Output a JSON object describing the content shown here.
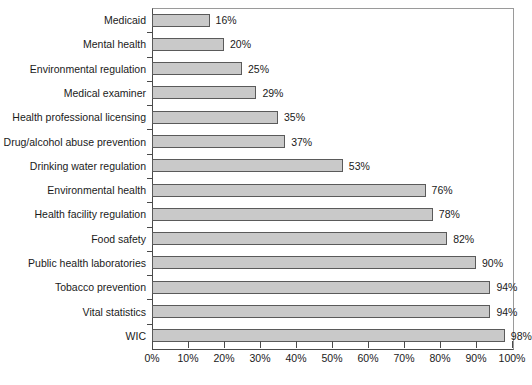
{
  "chart_data": {
    "type": "bar",
    "orientation": "horizontal",
    "title": "",
    "subtitle": "",
    "xlabel": "",
    "ylabel": "",
    "xlim": [
      0,
      100
    ],
    "grid": false,
    "legend": null,
    "value_suffix": "%",
    "xticks": [
      "0%",
      "10%",
      "20%",
      "30%",
      "40%",
      "50%",
      "60%",
      "70%",
      "80%",
      "90%",
      "100%"
    ],
    "xtick_values": [
      0,
      10,
      20,
      30,
      40,
      50,
      60,
      70,
      80,
      90,
      100
    ],
    "categories": [
      "Medicaid",
      "Mental health",
      "Environmental regulation",
      "Medical examiner",
      "Health professional licensing",
      "Drug/alcohol abuse prevention",
      "Drinking water regulation",
      "Environmental health",
      "Health facility regulation",
      "Food safety",
      "Public health laboratories",
      "Tobacco prevention",
      "Vital statistics",
      "WIC"
    ],
    "values": [
      16,
      20,
      25,
      29,
      35,
      37,
      53,
      76,
      78,
      82,
      90,
      94,
      94,
      98
    ],
    "data_labels": [
      "16%",
      "20%",
      "25%",
      "29%",
      "35%",
      "37%",
      "53%",
      "76%",
      "78%",
      "82%",
      "90%",
      "94%",
      "94%",
      "98%"
    ],
    "colors": {
      "bar_fill": "#c9c9c9",
      "bar_border": "#5a5a5a",
      "axis": "#4a4a4a",
      "frame": "#9a9a9a",
      "text": "#1a1a1a",
      "background": "#ffffff"
    }
  }
}
